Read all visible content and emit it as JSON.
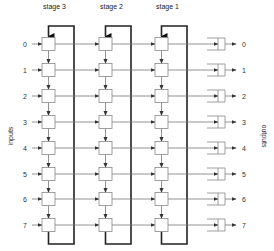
{
  "diagram": {
    "stages": [
      {
        "label": "stage 3",
        "box_x": 42,
        "feedback_x": 74
      },
      {
        "label": "stage 2",
        "box_x": 99,
        "feedback_x": 131
      },
      {
        "label": "stage 1",
        "box_x": 155,
        "feedback_x": 187
      }
    ],
    "inputs": {
      "axis_label": "inputs",
      "labels": [
        "0",
        "1",
        "2",
        "3",
        "4",
        "5",
        "6",
        "7"
      ]
    },
    "outputs": {
      "axis_label": "outputs",
      "labels": [
        "0",
        "1",
        "2",
        "3",
        "4",
        "5",
        "6",
        "7"
      ]
    },
    "row_y": [
      44,
      70,
      96,
      122,
      148,
      174,
      199,
      225
    ],
    "colors": {
      "thin_line": "#777777",
      "thick_line": "#222222",
      "box_stroke": "#888888",
      "text": "#333333"
    }
  }
}
